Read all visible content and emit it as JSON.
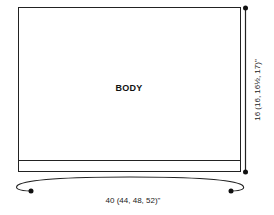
{
  "diagram": {
    "piece_label": "BODY",
    "width_measurement": "40 (44, 48, 52)\"",
    "height_measurement": "16 (16, 16½, 17)\"",
    "line_color": "#222222",
    "background": "#ffffff"
  }
}
